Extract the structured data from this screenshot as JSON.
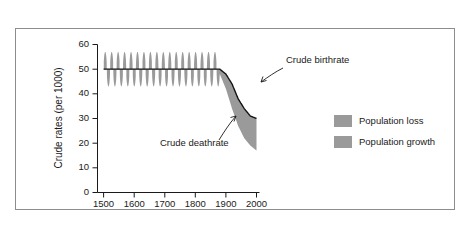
{
  "chart_data": {
    "type": "area",
    "title": "",
    "subtitle": "",
    "xlabel": "",
    "ylabel": "Crude rates (per 1000)",
    "xlim": [
      1480,
      2010
    ],
    "ylim": [
      0,
      60
    ],
    "xticks": [
      "1500",
      "1600",
      "1700",
      "1800",
      "1900",
      "2000"
    ],
    "xtick_values": [
      1500,
      1600,
      1700,
      1800,
      1900,
      2000
    ],
    "yticks": [
      "0",
      "10",
      "20",
      "30",
      "40",
      "50",
      "60"
    ],
    "ytick_values": [
      0,
      10,
      20,
      30,
      40,
      50,
      60
    ],
    "grid": false,
    "legend_position": "right",
    "legend": [
      {
        "label": "Population loss",
        "color": "#9a9a9a"
      },
      {
        "label": "Population growth",
        "color": "#9a9a9a"
      }
    ],
    "annotations": [
      {
        "label": "Crude birthrate",
        "x": 1952,
        "y": 52
      },
      {
        "label": "Crude deathrate",
        "x": 1790,
        "y": 27
      }
    ],
    "series": [
      {
        "name": "Crude birthrate",
        "color": "#111111",
        "x": [
          1500,
          1600,
          1700,
          1800,
          1860,
          1880,
          1900,
          1920,
          1940,
          1960,
          1980,
          2000
        ],
        "values": [
          50,
          50,
          50,
          50,
          50,
          50,
          48,
          44,
          38,
          34,
          31,
          30
        ]
      },
      {
        "name": "Crude deathrate",
        "color": "#9a9a9a",
        "x": [
          1500,
          1600,
          1700,
          1800,
          1860,
          1880,
          1900,
          1920,
          1940,
          1960,
          1980,
          2000
        ],
        "values": [
          50,
          50,
          50,
          50,
          50,
          48,
          42,
          34,
          27,
          22,
          19,
          17
        ],
        "oscillation": {
          "description": "Crude deathrate spikes above and below the crude birthrate line",
          "start_x": 1500,
          "end_x": 1880,
          "peak_high": 57,
          "peak_low": 43,
          "cycles": 18
        }
      }
    ]
  },
  "axis": {
    "y_title": "Crude rates (per 1000)"
  }
}
